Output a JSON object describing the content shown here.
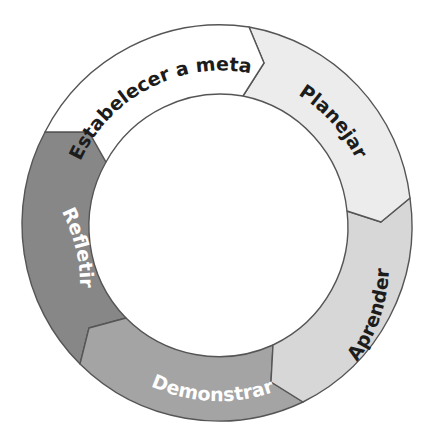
{
  "diagram": {
    "type": "cycle",
    "title": "",
    "center": [
      220,
      225
    ],
    "outer_radius": 197,
    "inner_radius": 131,
    "segments": [
      {
        "id": "estabelecer",
        "label": "Estabelecer a meta",
        "fill": "#ffffff",
        "text_color": "#1c1c1c"
      },
      {
        "id": "planejar",
        "label": "Planejar",
        "fill": "#ececec",
        "text_color": "#1c1c1c"
      },
      {
        "id": "aprender",
        "label": "Aprender",
        "fill": "#d7d7d7",
        "text_color": "#1c1c1c"
      },
      {
        "id": "demonstrar",
        "label": "Demonstrar",
        "fill": "#a4a4a4",
        "text_color": "#ffffff"
      },
      {
        "id": "refletir",
        "label": "Refletir",
        "fill": "#878787",
        "text_color": "#ffffff"
      }
    ],
    "flow_direction": "clockwise"
  }
}
